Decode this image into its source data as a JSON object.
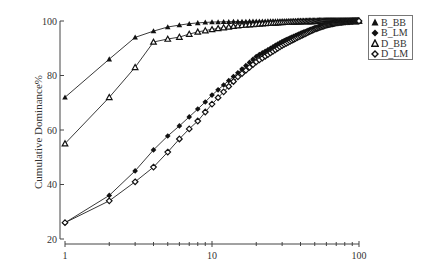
{
  "chart_data": {
    "type": "line",
    "title": "",
    "xlabel": "",
    "ylabel": "Cumulative Dominance%",
    "xscale": "log",
    "xlim": [
      1,
      100
    ],
    "ylim": [
      20,
      100
    ],
    "xticks": [
      1,
      10,
      100
    ],
    "yticks": [
      20,
      40,
      60,
      80,
      100
    ],
    "grid": false,
    "legend_position": "upper right",
    "series": [
      {
        "name": "B_BB",
        "marker": "filled-triangle",
        "x": [
          1,
          2,
          3,
          4,
          5,
          6,
          7,
          8,
          9,
          10,
          12,
          15,
          20,
          30,
          40,
          50,
          60,
          70,
          80,
          90,
          100
        ],
        "values": [
          72,
          86,
          94,
          96.3,
          97.8,
          98.5,
          99.0,
          99.3,
          99.5,
          99.6,
          99.7,
          99.8,
          99.9,
          100,
          100,
          100,
          100,
          100,
          100,
          100,
          100
        ]
      },
      {
        "name": "B_LM",
        "marker": "filled-diamond",
        "x": [
          1,
          2,
          3,
          4,
          5,
          6,
          7,
          8,
          9,
          10,
          12,
          15,
          20,
          30,
          40,
          50,
          60,
          70,
          80,
          90,
          100
        ],
        "values": [
          26,
          36,
          45,
          52.7,
          57.8,
          61.5,
          64.8,
          67.7,
          70.3,
          72.8,
          76.5,
          81,
          87,
          92.5,
          95.5,
          97.5,
          98.8,
          99.4,
          99.7,
          99.9,
          100
        ]
      },
      {
        "name": "D_BB",
        "marker": "open-triangle",
        "x": [
          1,
          2,
          3,
          4,
          5,
          6,
          7,
          8,
          9,
          10,
          12,
          15,
          20,
          30,
          40,
          50,
          60,
          70,
          80,
          90,
          100
        ],
        "values": [
          55,
          72,
          83,
          92.3,
          93.4,
          94.1,
          95.2,
          96,
          96.5,
          96.9,
          97.6,
          98.3,
          98.9,
          99.5,
          99.8,
          99.9,
          100,
          100,
          100,
          100,
          100
        ]
      },
      {
        "name": "D_LM",
        "marker": "open-diamond",
        "x": [
          1,
          2,
          3,
          4,
          5,
          6,
          7,
          8,
          9,
          10,
          12,
          15,
          20,
          30,
          40,
          50,
          60,
          70,
          80,
          90,
          100
        ],
        "values": [
          26,
          34,
          41,
          46.4,
          51.9,
          56.7,
          60.4,
          63.3,
          66.6,
          69.5,
          74,
          79.5,
          85,
          91,
          94.5,
          97,
          98.5,
          99.3,
          99.7,
          99.9,
          100
        ]
      }
    ]
  },
  "axes": {
    "ylabel": "Cumulative Dominance%",
    "x_tick_labels": [
      "1",
      "10",
      "100"
    ],
    "y_tick_labels": [
      "20",
      "40",
      "60",
      "80",
      "100"
    ]
  },
  "legend": {
    "items": [
      {
        "label": "B_BB"
      },
      {
        "label": "B_LM"
      },
      {
        "label": "D_BB"
      },
      {
        "label": "D_LM"
      }
    ]
  },
  "colors": {
    "line": "#222222",
    "axis": "#444444",
    "marker_fill": "#111111",
    "open_fill": "#ffffff"
  }
}
